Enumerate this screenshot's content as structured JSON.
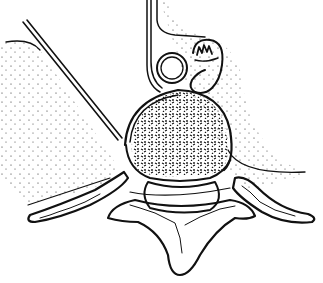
{
  "figure": {
    "type": "anatomical-line-drawing",
    "colors": {
      "ink": "#111111",
      "background": "#ffffff"
    },
    "labels": []
  }
}
